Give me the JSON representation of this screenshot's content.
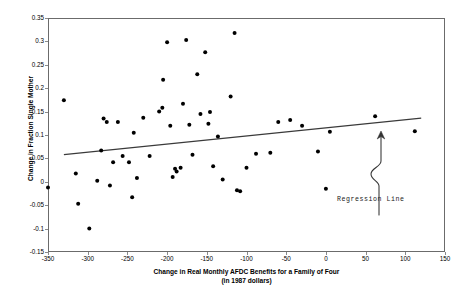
{
  "chart_data": {
    "type": "scatter",
    "title": "",
    "xlabel": "Change in Real Monthly AFDC Benefits for a Family of Four",
    "xlabel_line2": "(in 1987 dollars)",
    "ylabel": "Change in Fraction Single Mother",
    "xlim": [
      -350,
      150
    ],
    "ylim": [
      -0.15,
      0.35
    ],
    "xticks": [
      -350,
      -300,
      -250,
      -200,
      -150,
      -100,
      -50,
      0,
      50,
      100,
      150
    ],
    "xtick_labels": [
      "-350",
      "-300",
      "-250",
      "-200",
      "-150",
      "-100",
      "-50",
      "0",
      "50",
      "100",
      "150"
    ],
    "yticks": [
      -0.15,
      -0.1,
      -0.05,
      0,
      0.05,
      0.1,
      0.15,
      0.2,
      0.25,
      0.3,
      0.35
    ],
    "ytick_labels": [
      "-0.15",
      "-0.1",
      "-0.05",
      "0",
      "0.05",
      "0.1",
      "0.15",
      "0.2",
      "0.25",
      "0.3",
      "0.35"
    ],
    "grid": false,
    "legend": null,
    "marker_color": "#000000",
    "line_color": "#3a3a3a",
    "frame_color": "#6b6b6b",
    "points": [
      {
        "x": -350,
        "y": -0.012
      },
      {
        "x": -330,
        "y": 0.174
      },
      {
        "x": -315,
        "y": 0.018
      },
      {
        "x": -312,
        "y": -0.047
      },
      {
        "x": -298,
        "y": -0.1
      },
      {
        "x": -288,
        "y": 0.002
      },
      {
        "x": -283,
        "y": 0.067
      },
      {
        "x": -280,
        "y": 0.135
      },
      {
        "x": -276,
        "y": 0.128
      },
      {
        "x": -272,
        "y": -0.008
      },
      {
        "x": -268,
        "y": 0.042
      },
      {
        "x": -262,
        "y": 0.128
      },
      {
        "x": -256,
        "y": 0.055
      },
      {
        "x": -248,
        "y": 0.042
      },
      {
        "x": -244,
        "y": -0.033
      },
      {
        "x": -242,
        "y": 0.105
      },
      {
        "x": -238,
        "y": 0.008
      },
      {
        "x": -230,
        "y": 0.137
      },
      {
        "x": -222,
        "y": 0.055
      },
      {
        "x": -210,
        "y": 0.15
      },
      {
        "x": -206,
        "y": 0.158
      },
      {
        "x": -205,
        "y": 0.218
      },
      {
        "x": -200,
        "y": 0.298
      },
      {
        "x": -196,
        "y": 0.12
      },
      {
        "x": -193,
        "y": 0.01
      },
      {
        "x": -190,
        "y": 0.028
      },
      {
        "x": -188,
        "y": 0.022
      },
      {
        "x": -183,
        "y": 0.03
      },
      {
        "x": -180,
        "y": 0.167
      },
      {
        "x": -176,
        "y": 0.303
      },
      {
        "x": -172,
        "y": 0.122
      },
      {
        "x": -168,
        "y": 0.058
      },
      {
        "x": -162,
        "y": 0.23
      },
      {
        "x": -158,
        "y": 0.145
      },
      {
        "x": -152,
        "y": 0.277
      },
      {
        "x": -148,
        "y": 0.124
      },
      {
        "x": -146,
        "y": 0.149
      },
      {
        "x": -142,
        "y": 0.033
      },
      {
        "x": -136,
        "y": 0.097
      },
      {
        "x": -130,
        "y": 0.005
      },
      {
        "x": -120,
        "y": 0.182
      },
      {
        "x": -115,
        "y": 0.318
      },
      {
        "x": -112,
        "y": -0.018
      },
      {
        "x": -108,
        "y": -0.02
      },
      {
        "x": -100,
        "y": 0.03
      },
      {
        "x": -88,
        "y": 0.06
      },
      {
        "x": -70,
        "y": 0.062
      },
      {
        "x": -60,
        "y": 0.128
      },
      {
        "x": -45,
        "y": 0.132
      },
      {
        "x": -30,
        "y": 0.12
      },
      {
        "x": -10,
        "y": 0.065
      },
      {
        "x": 0,
        "y": -0.015
      },
      {
        "x": 5,
        "y": 0.107
      },
      {
        "x": 62,
        "y": 0.14
      },
      {
        "x": 112,
        "y": 0.108
      }
    ],
    "regression_line": {
      "label": "Regression Line",
      "x_start": -330,
      "y_start": 0.058,
      "x_end": 120,
      "y_end": 0.136
    },
    "annotation": {
      "text": "Regression Line",
      "arrow_style": "hand-drawn-squiggle-up",
      "arrow_target_x": 48,
      "arrow_target_y": 0.133
    }
  }
}
